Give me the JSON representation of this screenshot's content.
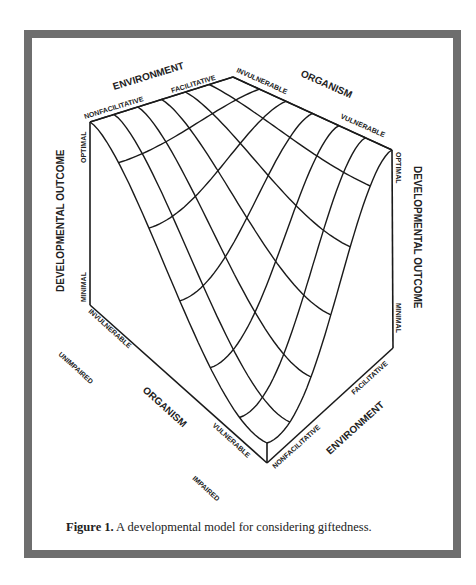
{
  "figure": {
    "caption_label": "Figure 1.",
    "caption_text": " A developmental model for considering giftedness."
  },
  "labels": {
    "environment_top": "ENVIRONMENT",
    "nonfacilitative_top": "NONFACILITATIVE",
    "facilitative_top": "FACILITATIVE",
    "invulnerable_top": "INVULNERABLE",
    "organism_top": "ORGANISM",
    "vulnerable_top": "VULNERABLE",
    "developmental_outcome_left": "DEVELOPMENTAL OUTCOME",
    "optimal_left": "OPTIMAL",
    "minimal_left": "MINIMAL",
    "developmental_outcome_right": "DEVELOPMENTAL OUTCOME",
    "optimal_right": "OPTIMAL",
    "minimal_right": "MINIMAL",
    "invulnerable_bottom": "INVULNERABLE",
    "unimpaired": "UNIMPAIRED",
    "organism_bottom": "ORGANISM",
    "vulnerable_bottom": "VULNERABLE",
    "impaired": "IMPAIRED",
    "nonfacilitative_bottom": "NONFACILITATIVE",
    "facilitative_bottom": "FACILITATIVE",
    "environment_bottom": "ENVIRONMENT"
  },
  "geometry": {
    "top_left_corner": [
      90,
      122
    ],
    "top_apex": [
      233,
      77
    ],
    "top_right_corner": [
      392,
      150
    ],
    "left_bottom": [
      90,
      305
    ],
    "right_bottom": [
      393,
      348
    ],
    "bottom_vertex": [
      267,
      463
    ],
    "inner_vertex": [
      267,
      443
    ],
    "grid_divisions": 6,
    "line_color": "#1a1a1a",
    "frame_color": "#6e6e6e"
  }
}
